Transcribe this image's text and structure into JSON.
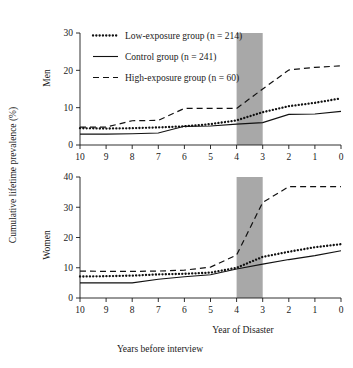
{
  "figure": {
    "ylabel": "Cumulative lifetime prevalence (%)",
    "xlabel_primary": "Year of Disaster",
    "xlabel_secondary": "Years before interview"
  },
  "legend": {
    "entries": [
      {
        "id": "low",
        "label": "Low-exposure group (n = 214)",
        "style": "dotted"
      },
      {
        "id": "control",
        "label": "Control group (n = 241)",
        "style": "solid"
      },
      {
        "id": "high",
        "label": "High-exposure group (n = 60)",
        "style": "dashed"
      }
    ]
  },
  "panels": {
    "men_label": "Men",
    "women_label": "Women"
  },
  "shading": {
    "color": "#a8a8a8",
    "x_start": 4,
    "x_end": 3
  },
  "chart_data": [
    {
      "type": "line",
      "title": "Men",
      "xlabel": "Year of Disaster",
      "ylabel": "Cumulative lifetime prevalence (%)",
      "xlim": [
        10,
        0
      ],
      "ylim": [
        0,
        30
      ],
      "xticks": [
        10,
        9,
        8,
        7,
        6,
        5,
        4,
        3,
        2,
        1,
        0
      ],
      "ytick_labels": [
        "0",
        "10",
        "20",
        "30"
      ],
      "yticks": [
        0,
        10,
        20,
        30
      ],
      "x_inverted": true,
      "grid": false,
      "legend_position": "top-left",
      "x": [
        10,
        9,
        8,
        7,
        6,
        5,
        4,
        3,
        2,
        1,
        0
      ],
      "series": [
        {
          "name": "Low-exposure group (n = 214)",
          "style": "dotted",
          "values": [
            4.5,
            4.4,
            4.5,
            4.7,
            5.0,
            5.6,
            6.6,
            8.8,
            10.4,
            11.3,
            12.5
          ]
        },
        {
          "name": "Control group (n = 241)",
          "style": "solid",
          "values": [
            2.9,
            2.9,
            3.0,
            3.2,
            5.0,
            5.1,
            5.6,
            6.0,
            8.2,
            8.3,
            9.0
          ]
        },
        {
          "name": "High-exposure group (n = 60)",
          "style": "dashed",
          "values": [
            4.8,
            4.8,
            6.5,
            6.6,
            9.8,
            9.8,
            9.8,
            15.0,
            20.1,
            20.8,
            21.2
          ]
        }
      ]
    },
    {
      "type": "line",
      "title": "Women",
      "xlabel": "Year of Disaster",
      "ylabel": "Cumulative lifetime prevalence (%)",
      "xlim": [
        10,
        0
      ],
      "ylim": [
        0,
        40
      ],
      "xticks": [
        10,
        9,
        8,
        7,
        6,
        5,
        4,
        3,
        2,
        1,
        0
      ],
      "ytick_labels": [
        "0",
        "10",
        "20",
        "30",
        "40"
      ],
      "yticks": [
        0,
        10,
        20,
        30,
        40
      ],
      "x_inverted": true,
      "grid": false,
      "legend_position": "none",
      "x": [
        10,
        9,
        8,
        7,
        6,
        5,
        4,
        3,
        2,
        1,
        0
      ],
      "series": [
        {
          "name": "Low-exposure group (n = 214)",
          "style": "dotted",
          "values": [
            7.1,
            7.2,
            7.4,
            7.8,
            8.0,
            8.4,
            10.0,
            13.6,
            15.3,
            16.8,
            17.8
          ]
        },
        {
          "name": "Control group (n = 241)",
          "style": "solid",
          "values": [
            5.0,
            5.0,
            5.0,
            6.2,
            7.0,
            7.7,
            9.6,
            11.2,
            12.7,
            14.0,
            15.6
          ]
        },
        {
          "name": "High-exposure group (n = 60)",
          "style": "dashed",
          "values": [
            8.9,
            8.8,
            8.8,
            8.9,
            9.2,
            10.2,
            14.2,
            31.6,
            36.8,
            36.8,
            36.8
          ]
        }
      ]
    }
  ]
}
